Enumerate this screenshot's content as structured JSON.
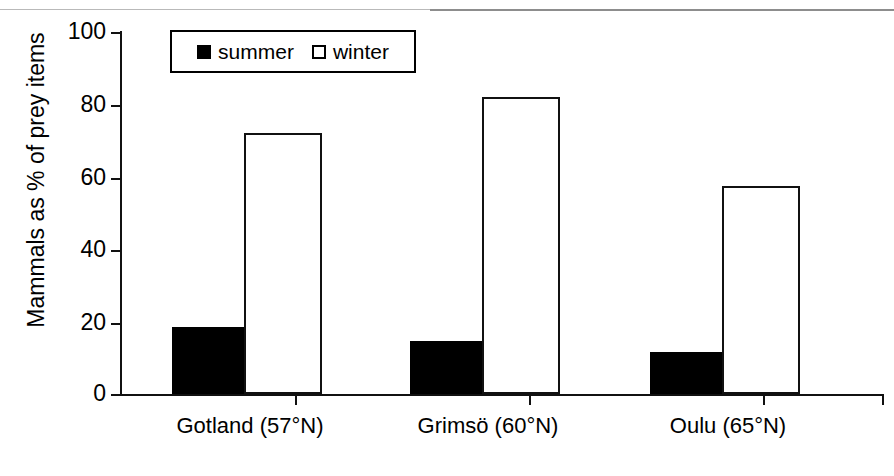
{
  "chart_data": {
    "type": "bar",
    "title": "",
    "subtitle": "",
    "xlabel": "",
    "ylabel": "Mammals as % of prey items",
    "ylim": [
      0,
      100
    ],
    "yticks": [
      "0",
      "20",
      "40",
      "60",
      "80",
      "100"
    ],
    "ytick_values": [
      0,
      20,
      40,
      60,
      80,
      100
    ],
    "grid": false,
    "legend_position": "top-left-inside",
    "categories": [
      "Gotland (57°N)",
      "Grimsö (60°N)",
      "Oulu (65°N)"
    ],
    "series": [
      {
        "name": "summer",
        "style": "filled-black",
        "values": [
          18.5,
          14.5,
          11.5
        ]
      },
      {
        "name": "winter",
        "style": "open-white",
        "values": [
          72,
          82,
          57.5
        ]
      }
    ]
  },
  "legend": {
    "entries": [
      {
        "label": "summer",
        "marker": "filled-square-marker"
      },
      {
        "label": "winter",
        "marker": "open-square-marker"
      }
    ]
  },
  "axes": {
    "y_title": "Mammals as % of prey items",
    "y_tick_labels": [
      "100",
      "80",
      "60",
      "40",
      "20",
      "0"
    ],
    "x_tick_labels": [
      "Gotland (57°N)",
      "Grimsö (60°N)",
      "Oulu (65°N)"
    ]
  },
  "colors": {
    "summer": "#000000",
    "winter": "#ffffff",
    "axis": "#111111",
    "rule": "#8d8d8d",
    "background": "#ffffff"
  }
}
